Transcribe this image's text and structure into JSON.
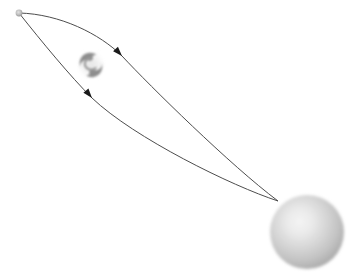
{
  "scene": {
    "title": "Gravitational lensing ray diagram",
    "width": 347,
    "height": 272,
    "background_color": "#ffffff"
  },
  "palette": {
    "background": "#ffffff",
    "ray_stroke": "#4d4d4d",
    "arrow_fill": "#1a1a1a",
    "source_dot_fill": "#b9b9b9",
    "source_dot_edge": "#8f8f8f",
    "sphere_highlight": "#f2f2f2",
    "sphere_mid": "#c6c6c6",
    "sphere_edge": "#9c9c9c",
    "swirl_gray": "#8a8a8a",
    "swirl_halo": "#d8d8d8"
  },
  "objects": {
    "source": {
      "name": "light-source-point",
      "label": "",
      "cx": 19,
      "cy": 13,
      "r": 3.4
    },
    "lens": {
      "name": "lensing-mass-swirl",
      "label": "",
      "cx": 91,
      "cy": 65,
      "r": 14,
      "glyph": "vortex-spiral"
    },
    "observer": {
      "name": "observer-sphere",
      "label": "",
      "cx": 307,
      "cy": 232,
      "r": 37,
      "highlight_cx": 298,
      "highlight_cy": 221
    },
    "convergence_point": {
      "name": "ray-convergence-point",
      "x": 278,
      "y": 201
    }
  },
  "rays": [
    {
      "name": "upper-light-ray",
      "path": "M 19 13 C 60 14, 100 34, 122 56 C 150 86, 230 165, 278 201",
      "arrow": {
        "x": 122,
        "y": 56,
        "angle_deg": 227
      }
    },
    {
      "name": "lower-light-ray",
      "path": "M 19 13 C 42 42, 70 76, 92 98 C 134 138, 232 186, 278 201",
      "arrow": {
        "x": 92,
        "y": 98,
        "angle_deg": 230
      }
    }
  ],
  "annotations": {
    "source_label": "",
    "lens_label": "",
    "observer_label": ""
  }
}
